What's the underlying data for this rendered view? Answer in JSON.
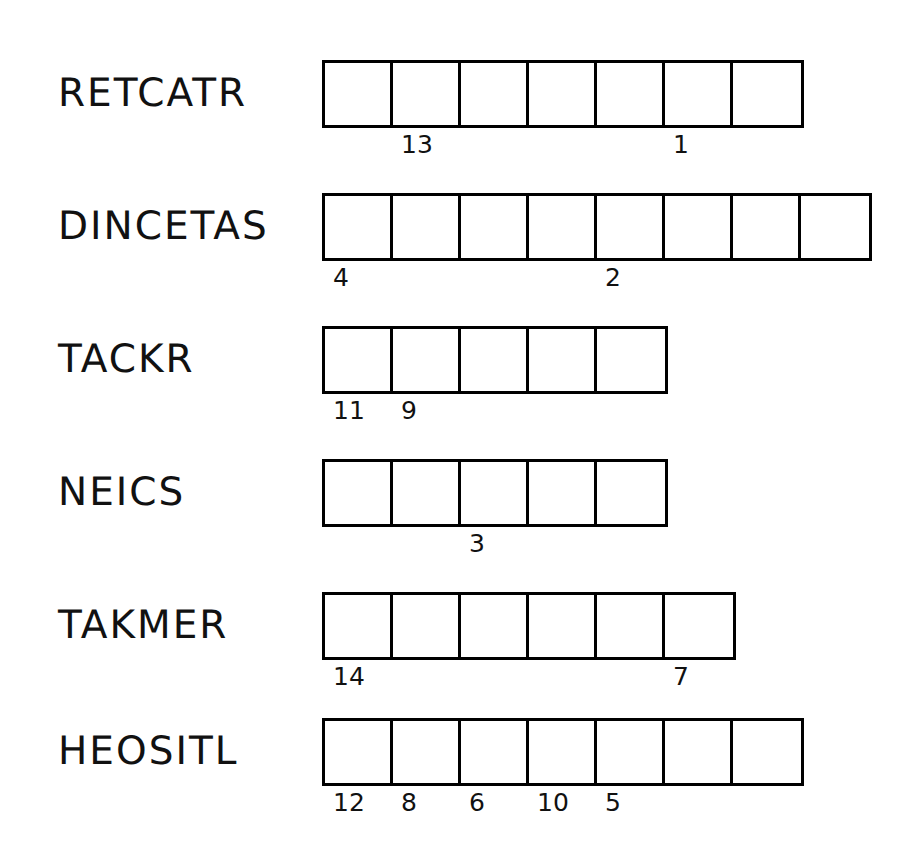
{
  "page": {
    "background_color": "#ffffff",
    "ink_color": "#000000",
    "box_size_px": 68,
    "box_border_px": 3
  },
  "rows": [
    {
      "word": "RETCATR",
      "box_count": 7,
      "top": 60,
      "left": 322,
      "clues": [
        {
          "number": "13",
          "cell_index": 1
        },
        {
          "number": "1",
          "cell_index": 5
        }
      ]
    },
    {
      "word": "DINCETAS",
      "box_count": 8,
      "top": 193,
      "left": 322,
      "clues": [
        {
          "number": "4",
          "cell_index": 0
        },
        {
          "number": "2",
          "cell_index": 4
        }
      ]
    },
    {
      "word": "TACKR",
      "box_count": 5,
      "top": 326,
      "left": 322,
      "clues": [
        {
          "number": "11",
          "cell_index": 0
        },
        {
          "number": "9",
          "cell_index": 1
        }
      ]
    },
    {
      "word": "NEICS",
      "box_count": 5,
      "top": 459,
      "left": 322,
      "clues": [
        {
          "number": "3",
          "cell_index": 2
        }
      ]
    },
    {
      "word": "TAKMER",
      "box_count": 6,
      "top": 592,
      "left": 322,
      "clues": [
        {
          "number": "14",
          "cell_index": 0
        },
        {
          "number": "7",
          "cell_index": 5
        }
      ]
    },
    {
      "word": "HEOSITL",
      "box_count": 7,
      "top": 718,
      "left": 322,
      "clues": [
        {
          "number": "12",
          "cell_index": 0
        },
        {
          "number": "8",
          "cell_index": 1
        },
        {
          "number": "6",
          "cell_index": 2
        },
        {
          "number": "10",
          "cell_index": 3
        },
        {
          "number": "5",
          "cell_index": 4
        }
      ]
    }
  ]
}
